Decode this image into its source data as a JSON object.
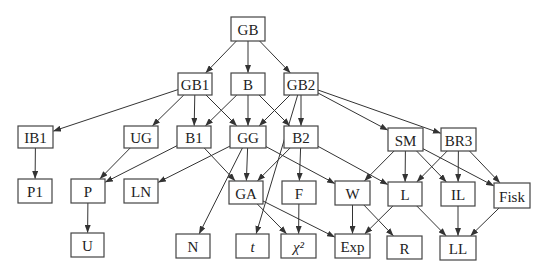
{
  "diagram": {
    "type": "directed-graph",
    "nodes": [
      {
        "id": "GB",
        "label": "GB",
        "x": 231,
        "y": 17,
        "w": 34,
        "h": 24
      },
      {
        "id": "GB1",
        "label": "GB1",
        "x": 178,
        "y": 73,
        "w": 34,
        "h": 22
      },
      {
        "id": "B",
        "label": "B",
        "x": 231,
        "y": 73,
        "w": 34,
        "h": 22
      },
      {
        "id": "GB2",
        "label": "GB2",
        "x": 284,
        "y": 73,
        "w": 34,
        "h": 22
      },
      {
        "id": "IB1",
        "label": "IB1",
        "x": 18,
        "y": 126,
        "w": 35,
        "h": 22
      },
      {
        "id": "UG",
        "label": "UG",
        "x": 124,
        "y": 126,
        "w": 34,
        "h": 22
      },
      {
        "id": "B1",
        "label": "B1",
        "x": 177,
        "y": 126,
        "w": 34,
        "h": 22
      },
      {
        "id": "GG",
        "label": "GG",
        "x": 230,
        "y": 126,
        "w": 36,
        "h": 22
      },
      {
        "id": "B2",
        "label": "B2",
        "x": 284,
        "y": 126,
        "w": 34,
        "h": 22
      },
      {
        "id": "SM",
        "label": "SM",
        "x": 388,
        "y": 128,
        "w": 35,
        "h": 23
      },
      {
        "id": "BR3",
        "label": "BR3",
        "x": 441,
        "y": 128,
        "w": 35,
        "h": 23
      },
      {
        "id": "P1",
        "label": "P1",
        "x": 18,
        "y": 179,
        "w": 34,
        "h": 24
      },
      {
        "id": "P",
        "label": "P",
        "x": 71,
        "y": 179,
        "w": 34,
        "h": 24
      },
      {
        "id": "LN",
        "label": "LN",
        "x": 124,
        "y": 179,
        "w": 34,
        "h": 24
      },
      {
        "id": "GA",
        "label": "GA",
        "x": 229,
        "y": 181,
        "w": 34,
        "h": 23
      },
      {
        "id": "F",
        "label": "F",
        "x": 282,
        "y": 181,
        "w": 34,
        "h": 23
      },
      {
        "id": "W",
        "label": "W",
        "x": 335,
        "y": 181,
        "w": 35,
        "h": 24
      },
      {
        "id": "L",
        "label": "L",
        "x": 388,
        "y": 182,
        "w": 34,
        "h": 24
      },
      {
        "id": "IL",
        "label": "IL",
        "x": 441,
        "y": 182,
        "w": 34,
        "h": 24
      },
      {
        "id": "Fisk",
        "label": "Fisk",
        "x": 494,
        "y": 183,
        "w": 36,
        "h": 25
      },
      {
        "id": "U",
        "label": "U",
        "x": 71,
        "y": 233,
        "w": 33,
        "h": 24
      },
      {
        "id": "N",
        "label": "N",
        "x": 176,
        "y": 234,
        "w": 34,
        "h": 24
      },
      {
        "id": "t",
        "label": "t",
        "x": 236,
        "y": 234,
        "w": 33,
        "h": 24,
        "italic": true
      },
      {
        "id": "chi2",
        "label": "χ²",
        "x": 281,
        "y": 234,
        "w": 35,
        "h": 24,
        "italic": true
      },
      {
        "id": "Exp",
        "label": "Exp",
        "x": 335,
        "y": 234,
        "w": 35,
        "h": 24
      },
      {
        "id": "R",
        "label": "R",
        "x": 387,
        "y": 236,
        "w": 35,
        "h": 23
      },
      {
        "id": "LL",
        "label": "LL",
        "x": 440,
        "y": 236,
        "w": 36,
        "h": 24
      }
    ],
    "edges": [
      {
        "from": "GB",
        "to": "GB1"
      },
      {
        "from": "GB",
        "to": "B"
      },
      {
        "from": "GB",
        "to": "GB2"
      },
      {
        "from": "GB1",
        "to": "IB1"
      },
      {
        "from": "GB1",
        "to": "UG"
      },
      {
        "from": "GB1",
        "to": "B1"
      },
      {
        "from": "GB1",
        "to": "GG"
      },
      {
        "from": "B",
        "to": "B1"
      },
      {
        "from": "B",
        "to": "GG"
      },
      {
        "from": "B",
        "to": "B2"
      },
      {
        "from": "GB2",
        "to": "GG"
      },
      {
        "from": "GB2",
        "to": "B2"
      },
      {
        "from": "GB2",
        "to": "SM"
      },
      {
        "from": "GB2",
        "to": "BR3"
      },
      {
        "from": "GB2",
        "to": "t"
      },
      {
        "from": "IB1",
        "to": "P1"
      },
      {
        "from": "UG",
        "to": "P"
      },
      {
        "from": "B1",
        "to": "P"
      },
      {
        "from": "B1",
        "to": "GA"
      },
      {
        "from": "GG",
        "to": "LN"
      },
      {
        "from": "GG",
        "to": "GA"
      },
      {
        "from": "GG",
        "to": "N"
      },
      {
        "from": "GG",
        "to": "W"
      },
      {
        "from": "B2",
        "to": "GA"
      },
      {
        "from": "B2",
        "to": "F"
      },
      {
        "from": "B2",
        "to": "L"
      },
      {
        "from": "SM",
        "to": "W"
      },
      {
        "from": "SM",
        "to": "L"
      },
      {
        "from": "SM",
        "to": "IL"
      },
      {
        "from": "SM",
        "to": "Fisk"
      },
      {
        "from": "BR3",
        "to": "L"
      },
      {
        "from": "BR3",
        "to": "IL"
      },
      {
        "from": "BR3",
        "to": "Fisk"
      },
      {
        "from": "P",
        "to": "U"
      },
      {
        "from": "GA",
        "to": "chi2"
      },
      {
        "from": "GA",
        "to": "Exp"
      },
      {
        "from": "F",
        "to": "chi2"
      },
      {
        "from": "W",
        "to": "Exp"
      },
      {
        "from": "W",
        "to": "R"
      },
      {
        "from": "L",
        "to": "Exp"
      },
      {
        "from": "L",
        "to": "LL"
      },
      {
        "from": "IL",
        "to": "LL"
      },
      {
        "from": "Fisk",
        "to": "LL"
      }
    ],
    "colors": {
      "background": "#ffffff",
      "stroke": "#444444",
      "edge": "#333333",
      "text": "#222222"
    }
  }
}
